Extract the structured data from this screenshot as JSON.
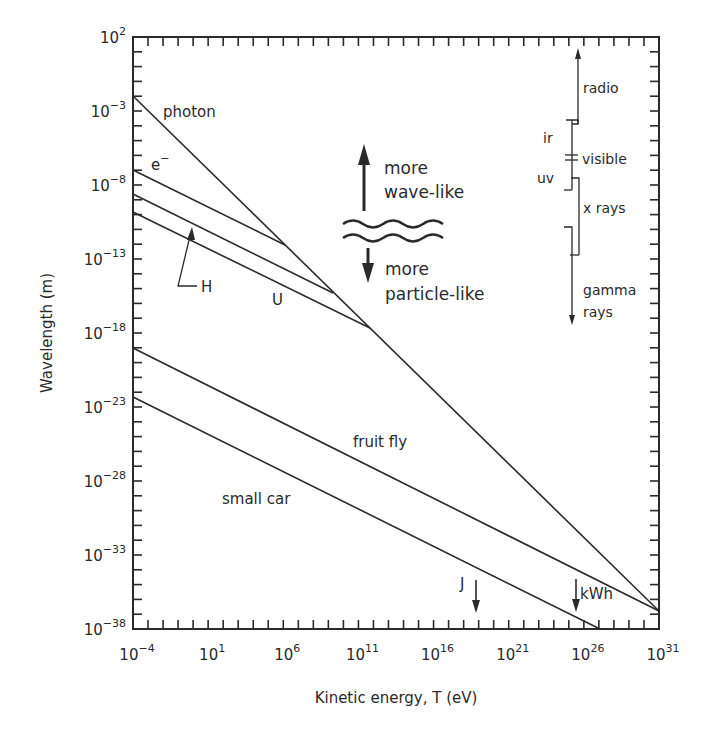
{
  "chart_data": {
    "type": "line",
    "title": "",
    "xlabel": "Kinetic energy, T (eV)",
    "ylabel": "Wavelength (m)",
    "xscale": "log",
    "yscale": "log",
    "xlim": [
      0.0001,
      1e+31
    ],
    "ylim": [
      1e-38,
      100.0
    ],
    "grid": false,
    "x_ticks": [
      {
        "base": "10",
        "exp": "-4",
        "value": 0.0001
      },
      {
        "base": "10",
        "exp": "1",
        "value": 10.0
      },
      {
        "base": "10",
        "exp": "6",
        "value": 1000000.0
      },
      {
        "base": "10",
        "exp": "11",
        "value": 100000000000.0
      },
      {
        "base": "10",
        "exp": "16",
        "value": 1e+16
      },
      {
        "base": "10",
        "exp": "21",
        "value": 1e+21
      },
      {
        "base": "10",
        "exp": "26",
        "value": 1e+26
      },
      {
        "base": "10",
        "exp": "31",
        "value": 1e+31
      }
    ],
    "y_ticks": [
      {
        "base": "10",
        "exp": "2",
        "value": 100.0
      },
      {
        "base": "10",
        "exp": "-3",
        "value": 0.001
      },
      {
        "base": "10",
        "exp": "-8",
        "value": 1e-08
      },
      {
        "base": "10",
        "exp": "-13",
        "value": 1e-13
      },
      {
        "base": "10",
        "exp": "-18",
        "value": 1e-18
      },
      {
        "base": "10",
        "exp": "-23",
        "value": 1e-23
      },
      {
        "base": "10",
        "exp": "-28",
        "value": 1e-28
      },
      {
        "base": "10",
        "exp": "-33",
        "value": 1e-33
      },
      {
        "base": "10",
        "exp": "-38",
        "value": 1e-38
      }
    ],
    "series": [
      {
        "name": "photon",
        "label": "photon",
        "log10_x": [
          -4,
          31
        ],
        "log10_y": [
          -2.0,
          -37.0
        ]
      },
      {
        "name": "electron",
        "label": "e",
        "label_sup": "−",
        "log10_x": [
          -4,
          6.1,
          31
        ],
        "log10_y": [
          -7.0,
          -12.1,
          -37.0
        ]
      },
      {
        "name": "hydrogen",
        "label": "H",
        "log10_x": [
          -4,
          9.3,
          31
        ],
        "log10_y": [
          -8.6,
          -15.3,
          -37.0
        ]
      },
      {
        "name": "uranium",
        "label": "U",
        "log10_x": [
          -4,
          11.8,
          31
        ],
        "log10_y": [
          -9.8,
          -17.7,
          -37.0
        ]
      },
      {
        "name": "fruit fly",
        "label": "fruit fly",
        "log10_x": [
          -4,
          31
        ],
        "log10_y": [
          -19.0,
          -36.8
        ]
      },
      {
        "name": "small car",
        "label": "small car",
        "log10_x": [
          -4,
          27.1
        ],
        "log10_y": [
          -22.3,
          -38.0
        ]
      }
    ],
    "annotations": {
      "wave_up": [
        "more",
        "wave-like"
      ],
      "particle_down": [
        "more",
        "particle-like"
      ],
      "energy_markers": [
        {
          "label": "J",
          "log10_x": 18.8
        },
        {
          "label": "kWh",
          "log10_x": 25.35
        }
      ],
      "spectrum": [
        {
          "label": "radio"
        },
        {
          "label": "ir"
        },
        {
          "label": "visible"
        },
        {
          "label": "uv"
        },
        {
          "label": "x rays"
        },
        {
          "label": "gamma",
          "label2": "rays"
        }
      ]
    }
  }
}
